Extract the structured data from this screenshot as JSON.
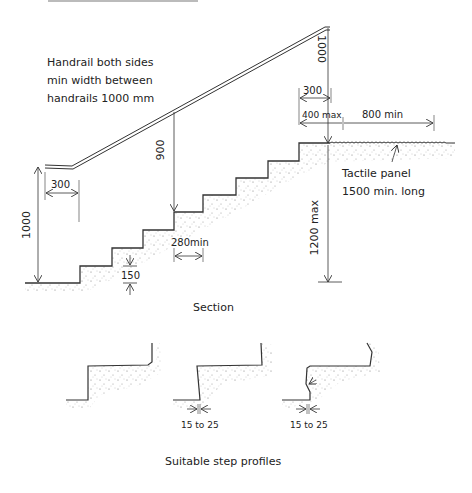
{
  "diagram": {
    "top_caption_cut": "",
    "handrail_note": {
      "line1": "Handrail both sides",
      "line2": "min width between",
      "line3": "handrails  1000 mm"
    },
    "dimensions": {
      "handrail_height_top": "1000",
      "handrail_extension_top": "300",
      "landing_400": "400 max",
      "landing_800": "800 min",
      "handrail_height_nosing": "900",
      "handrail_height_bottom": "1000",
      "handrail_extension_bottom": "300",
      "going": "280min",
      "riser": "150",
      "total_rise": "1200 max",
      "nosing_1": "15 to 25",
      "nosing_2": "15 to 25"
    },
    "tactile_note": {
      "line1": "Tactile panel",
      "line2": "1500 min. long"
    },
    "section_title": "Section",
    "profiles_title": "Suitable step profiles"
  }
}
